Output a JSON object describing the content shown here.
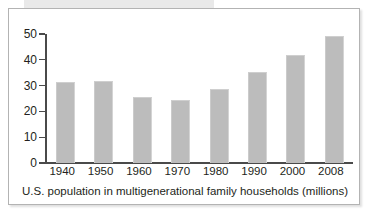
{
  "figure": {
    "caption": "U.S. population in multigenerational family households (millions)",
    "frame_color": "#b3b3b3",
    "bar_color": "#bcbcbc",
    "axis_color": "#4a4a4a",
    "text_color": "#231f20",
    "background": "#ffffff"
  },
  "chart_data": {
    "type": "bar",
    "title": "",
    "subtitle": "",
    "xlabel": "U.S. population in multigenerational family households (millions)",
    "ylabel": "",
    "categories": [
      "1940",
      "1950",
      "1960",
      "1970",
      "1980",
      "1990",
      "2000",
      "2008"
    ],
    "values": [
      31.5,
      31.7,
      25.4,
      24.6,
      28.5,
      35.2,
      42.0,
      49.4
    ],
    "ylim": [
      0,
      50
    ],
    "yticks": [
      0,
      10,
      20,
      30,
      40,
      50
    ],
    "ytick_labels": [
      "0",
      "10",
      "20",
      "30",
      "40",
      "50"
    ],
    "xtick_labels": [
      "1940",
      "1950",
      "1960",
      "1970",
      "1980",
      "1990",
      "2000",
      "2008"
    ],
    "grid": false,
    "legend": false,
    "legend_position": "none",
    "series": [
      {
        "name": "U.S. population in multigenerational family households (millions)",
        "values": [
          31.5,
          31.7,
          25.4,
          24.6,
          28.5,
          35.2,
          42.0,
          49.4
        ]
      }
    ]
  }
}
